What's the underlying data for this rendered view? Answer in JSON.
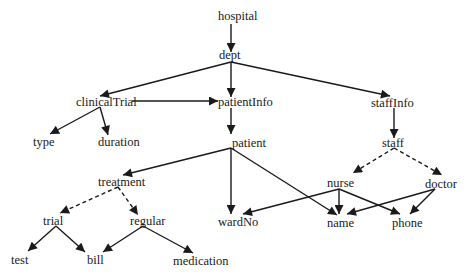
{
  "diagram": {
    "type": "schema-tree",
    "nodes": {
      "hospital": {
        "label": "hospital",
        "x": 218,
        "y": 20
      },
      "dept": {
        "label": "dept",
        "x": 219,
        "y": 59
      },
      "clinicalTrial": {
        "label": "clinicalTrial",
        "x": 76,
        "y": 106
      },
      "patientInfo": {
        "label": "patientInfo",
        "x": 218,
        "y": 106
      },
      "staffInfo": {
        "label": "staffInfo",
        "x": 371,
        "y": 107
      },
      "type": {
        "label": "type",
        "x": 33,
        "y": 146
      },
      "duration": {
        "label": "duration",
        "x": 98,
        "y": 146
      },
      "patient": {
        "label": "patient",
        "x": 232,
        "y": 147
      },
      "staff": {
        "label": "staff",
        "x": 382,
        "y": 147
      },
      "treatment": {
        "label": "treatment",
        "x": 98,
        "y": 186
      },
      "nurse": {
        "label": "nurse",
        "x": 327,
        "y": 187
      },
      "doctor": {
        "label": "doctor",
        "x": 425,
        "y": 188
      },
      "trial": {
        "label": "trial",
        "x": 43,
        "y": 225
      },
      "regular": {
        "label": "regular",
        "x": 130,
        "y": 225
      },
      "wardNo": {
        "label": "wardNo",
        "x": 218,
        "y": 226
      },
      "name": {
        "label": "name",
        "x": 327,
        "y": 227
      },
      "phone": {
        "label": "phone",
        "x": 392,
        "y": 227
      },
      "test": {
        "label": "test",
        "x": 11,
        "y": 264
      },
      "bill": {
        "label": "bill",
        "x": 87,
        "y": 264
      },
      "medication": {
        "label": "medication",
        "x": 173,
        "y": 265
      }
    },
    "edges": [
      {
        "from": "hospital",
        "to": "dept",
        "style": "solid",
        "path": [
          231,
          24,
          231,
          52
        ]
      },
      {
        "from": "dept",
        "to": "clinicalTrial",
        "style": "solid",
        "path": [
          231,
          62,
          100,
          96
        ]
      },
      {
        "from": "dept",
        "to": "patientInfo",
        "style": "solid",
        "path": [
          231,
          62,
          231,
          97
        ]
      },
      {
        "from": "dept",
        "to": "staffInfo",
        "style": "solid",
        "path": [
          231,
          62,
          390,
          96
        ]
      },
      {
        "from": "clinicalTrial",
        "to": "patientInfo",
        "style": "solid",
        "path": [
          132,
          101,
          218,
          101
        ]
      },
      {
        "from": "clinicalTrial",
        "to": "type",
        "style": "solid",
        "path": [
          100,
          107,
          50,
          134
        ]
      },
      {
        "from": "clinicalTrial",
        "to": "duration",
        "style": "solid",
        "path": [
          100,
          107,
          108,
          135
        ]
      },
      {
        "from": "patientInfo",
        "to": "patient",
        "style": "solid",
        "path": [
          231,
          108,
          231,
          134
        ]
      },
      {
        "from": "patient",
        "to": "treatment",
        "style": "solid",
        "path": [
          231,
          148,
          123,
          175
        ]
      },
      {
        "from": "patient",
        "to": "wardNo",
        "style": "solid",
        "path": [
          231,
          148,
          231,
          214
        ]
      },
      {
        "from": "patient",
        "to": "name",
        "style": "solid",
        "path": [
          231,
          148,
          337,
          215
        ]
      },
      {
        "from": "staffInfo",
        "to": "staff",
        "style": "solid",
        "path": [
          394,
          108,
          394,
          138
        ]
      },
      {
        "from": "staff",
        "to": "nurse",
        "style": "dashed",
        "path": [
          394,
          148,
          353,
          173
        ]
      },
      {
        "from": "staff",
        "to": "doctor",
        "style": "dashed",
        "path": [
          394,
          148,
          442,
          175
        ]
      },
      {
        "from": "treatment",
        "to": "trial",
        "style": "dashed",
        "path": [
          118,
          187,
          60,
          213
        ]
      },
      {
        "from": "treatment",
        "to": "regular",
        "style": "dashed",
        "path": [
          118,
          187,
          138,
          215
        ]
      },
      {
        "from": "trial",
        "to": "test",
        "style": "solid",
        "path": [
          56,
          226,
          28,
          251
        ]
      },
      {
        "from": "trial",
        "to": "bill",
        "style": "solid",
        "path": [
          56,
          226,
          85,
          252
        ]
      },
      {
        "from": "regular",
        "to": "bill",
        "style": "solid",
        "path": [
          143,
          226,
          103,
          252
        ]
      },
      {
        "from": "regular",
        "to": "medication",
        "style": "solid",
        "path": [
          143,
          226,
          193,
          253
        ]
      },
      {
        "from": "nurse",
        "to": "wardNo",
        "style": "solid",
        "path": [
          339,
          189,
          243,
          214
        ]
      },
      {
        "from": "nurse",
        "to": "name",
        "style": "solid",
        "path": [
          339,
          189,
          339,
          214
        ]
      },
      {
        "from": "nurse",
        "to": "phone",
        "style": "solid",
        "path": [
          339,
          189,
          400,
          214
        ]
      },
      {
        "from": "doctor",
        "to": "name",
        "style": "solid",
        "path": [
          435,
          189,
          347,
          214
        ]
      },
      {
        "from": "doctor",
        "to": "phone",
        "style": "solid",
        "path": [
          435,
          189,
          410,
          214
        ]
      }
    ],
    "colors": {
      "line": "#1a1a1a",
      "text": "#1a1a1a",
      "background": "#ffffff"
    }
  }
}
